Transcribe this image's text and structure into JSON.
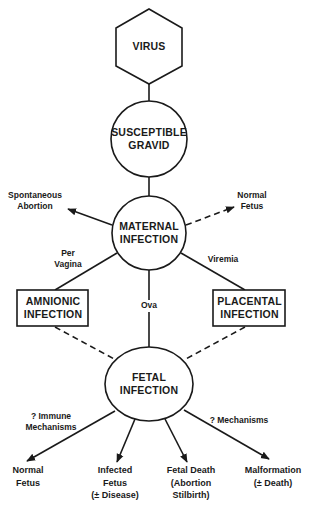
{
  "colors": {
    "ink": "#1a1a1a",
    "background": "#ffffff"
  },
  "nodes": {
    "virus": {
      "shape": "hexagon",
      "lines": [
        "VIRUS"
      ]
    },
    "susceptible_gravid": {
      "shape": "circle",
      "lines": [
        "SUSCEPTIBLE",
        "GRAVID"
      ]
    },
    "maternal_infection": {
      "shape": "circle",
      "lines": [
        "MATERNAL",
        "INFECTION"
      ]
    },
    "amnionic_infection": {
      "shape": "rectangle",
      "lines": [
        "AMNIONIC",
        "INFECTION"
      ]
    },
    "placental_infection": {
      "shape": "rectangle",
      "lines": [
        "PLACENTAL",
        "INFECTION"
      ]
    },
    "fetal_infection": {
      "shape": "ellipse",
      "lines": [
        "FETAL",
        "INFECTION"
      ]
    }
  },
  "maternal_outcomes": {
    "spontaneous_abortion": {
      "lines": [
        "Spontaneous",
        "Abortion"
      ],
      "edge_style": "solid-arrow"
    },
    "normal_fetus": {
      "lines": [
        "Normal",
        "Fetus"
      ],
      "edge_style": "dashed-arrow"
    }
  },
  "routes": {
    "per_vagina": {
      "lines": [
        "Per",
        "Vagina"
      ],
      "from": "maternal_infection",
      "to": "amnionic_infection",
      "edge_style": "solid"
    },
    "viremia": {
      "lines": [
        "Viremia"
      ],
      "from": "maternal_infection",
      "to": "placental_infection",
      "edge_style": "solid"
    },
    "ova": {
      "lines": [
        "Ova"
      ],
      "from": "maternal_infection",
      "to": "fetal_infection",
      "edge_style": "solid"
    },
    "amnionic_to_fetal": {
      "from": "amnionic_infection",
      "to": "fetal_infection",
      "edge_style": "dashed"
    },
    "placental_to_fetal": {
      "from": "placental_infection",
      "to": "fetal_infection",
      "edge_style": "dashed"
    }
  },
  "mechanism_labels": {
    "immune": {
      "lines": [
        "? Immune",
        "Mechanisms"
      ]
    },
    "mechanisms": {
      "lines": [
        "? Mechanisms"
      ]
    }
  },
  "fetal_outcomes": [
    {
      "lines": [
        "Normal",
        "Fetus"
      ]
    },
    {
      "lines": [
        "Infected",
        "Fetus",
        "(± Disease)"
      ]
    },
    {
      "lines": [
        "Fetal Death",
        "(Abortion",
        "Stilbirth)"
      ]
    },
    {
      "lines": [
        "Malformation",
        "(± Death)"
      ]
    }
  ]
}
